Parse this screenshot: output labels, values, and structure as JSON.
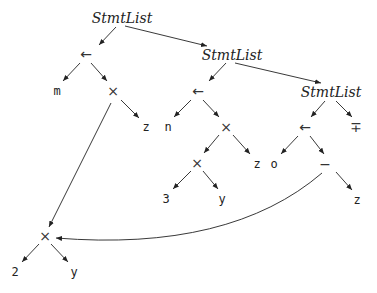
{
  "diagram": {
    "type": "abstract-syntax-tree / DAG",
    "nodes": [
      {
        "id": "sl1",
        "label": "StmtList",
        "x": 122,
        "y": 18,
        "style": "ital"
      },
      {
        "id": "as1",
        "label": "←",
        "x": 86,
        "y": 54,
        "style": "op"
      },
      {
        "id": "m",
        "label": "m",
        "x": 57,
        "y": 91,
        "style": "mono"
      },
      {
        "id": "mul1",
        "label": "×",
        "x": 113,
        "y": 91,
        "style": "op"
      },
      {
        "id": "z1",
        "label": "z",
        "x": 146,
        "y": 127,
        "style": "mono"
      },
      {
        "id": "sl2",
        "label": "StmtList",
        "x": 232,
        "y": 55,
        "style": "ital"
      },
      {
        "id": "as2",
        "label": "←",
        "x": 198,
        "y": 91,
        "style": "op"
      },
      {
        "id": "n",
        "label": "n",
        "x": 168,
        "y": 127,
        "style": "mono"
      },
      {
        "id": "mul2",
        "label": "×",
        "x": 226,
        "y": 127,
        "style": "op"
      },
      {
        "id": "z2",
        "label": "z",
        "x": 257,
        "y": 164,
        "style": "mono"
      },
      {
        "id": "mul3",
        "label": "×",
        "x": 197,
        "y": 163,
        "style": "op"
      },
      {
        "id": "c3",
        "label": "3",
        "x": 166,
        "y": 199,
        "style": "mono"
      },
      {
        "id": "y1",
        "label": "y",
        "x": 222,
        "y": 199,
        "style": "mono"
      },
      {
        "id": "sl3",
        "label": "StmtList",
        "x": 331,
        "y": 92,
        "style": "ital"
      },
      {
        "id": "as3",
        "label": "←",
        "x": 305,
        "y": 127,
        "style": "op"
      },
      {
        "id": "pm",
        "label": "∓",
        "x": 356,
        "y": 127,
        "style": "op"
      },
      {
        "id": "o",
        "label": "o",
        "x": 274,
        "y": 164,
        "style": "mono"
      },
      {
        "id": "minus",
        "label": "−",
        "x": 325,
        "y": 164,
        "style": "op"
      },
      {
        "id": "z3",
        "label": "z",
        "x": 357,
        "y": 200,
        "style": "mono"
      },
      {
        "id": "mul4",
        "label": "×",
        "x": 45,
        "y": 236,
        "style": "op"
      },
      {
        "id": "c2",
        "label": "2",
        "x": 15,
        "y": 272,
        "style": "mono"
      },
      {
        "id": "y2",
        "label": "y",
        "x": 74,
        "y": 272,
        "style": "mono"
      }
    ],
    "edges": [
      {
        "x1": 116,
        "y1": 27,
        "x2": 99,
        "y2": 45
      },
      {
        "x1": 125,
        "y1": 26,
        "x2": 207,
        "y2": 46
      },
      {
        "x1": 80,
        "y1": 63,
        "x2": 63,
        "y2": 81
      },
      {
        "x1": 91,
        "y1": 63,
        "x2": 107,
        "y2": 81
      },
      {
        "x1": 121,
        "y1": 100,
        "x2": 139,
        "y2": 118
      },
      {
        "x1": 111,
        "y1": 103,
        "x2": 49,
        "y2": 227,
        "note": "shared subexpression"
      },
      {
        "x1": 226,
        "y1": 63,
        "x2": 209,
        "y2": 81
      },
      {
        "x1": 235,
        "y1": 63,
        "x2": 321,
        "y2": 83
      },
      {
        "x1": 191,
        "y1": 100,
        "x2": 174,
        "y2": 117
      },
      {
        "x1": 203,
        "y1": 100,
        "x2": 219,
        "y2": 117
      },
      {
        "x1": 233,
        "y1": 135,
        "x2": 250,
        "y2": 154
      },
      {
        "x1": 219,
        "y1": 135,
        "x2": 204,
        "y2": 153
      },
      {
        "x1": 191,
        "y1": 171,
        "x2": 173,
        "y2": 189
      },
      {
        "x1": 203,
        "y1": 171,
        "x2": 218,
        "y2": 189
      },
      {
        "x1": 325,
        "y1": 101,
        "x2": 311,
        "y2": 117
      },
      {
        "x1": 336,
        "y1": 101,
        "x2": 352,
        "y2": 117
      },
      {
        "x1": 298,
        "y1": 136,
        "x2": 281,
        "y2": 154
      },
      {
        "x1": 310,
        "y1": 136,
        "x2": 324,
        "y2": 154
      },
      {
        "x1": 336,
        "y1": 172,
        "x2": 352,
        "y2": 190
      },
      {
        "x1": 39,
        "y1": 244,
        "x2": 22,
        "y2": 262
      },
      {
        "x1": 51,
        "y1": 244,
        "x2": 68,
        "y2": 262
      }
    ],
    "curves": [
      {
        "d": "M 322 173 Q 230 252 56 238",
        "note": "minus -> shared ×"
      }
    ]
  }
}
